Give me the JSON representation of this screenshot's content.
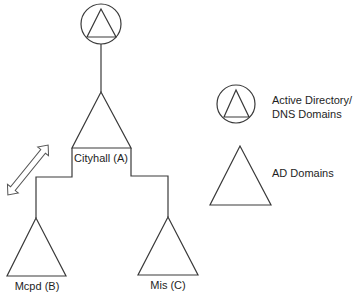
{
  "diagram": {
    "type": "domain-tree",
    "root": {
      "kind": "active-directory-dns-domain",
      "icon": "circle-triangle-icon"
    },
    "nodes": [
      {
        "id": "A",
        "label": "Cityhall (A)",
        "kind": "ad-domain"
      },
      {
        "id": "B",
        "label": "Mcpd (B)",
        "kind": "ad-domain"
      },
      {
        "id": "C",
        "label": "Mis (C)",
        "kind": "ad-domain"
      }
    ],
    "edges": [
      {
        "from": "root",
        "to": "A"
      },
      {
        "from": "A",
        "to": "B"
      },
      {
        "from": "A",
        "to": "C"
      }
    ],
    "trust_arrow": {
      "between": [
        "A",
        "B"
      ],
      "style": "double-headed-hollow"
    }
  },
  "legend": {
    "items": [
      {
        "icon": "circle-triangle-icon",
        "label_line1": "Active Directory/",
        "label_line2": "DNS Domains"
      },
      {
        "icon": "triangle-icon",
        "label": "AD Domains"
      }
    ]
  },
  "colors": {
    "line": "#3a3a3a",
    "text": "#1e1e1e",
    "background": "#ffffff"
  }
}
